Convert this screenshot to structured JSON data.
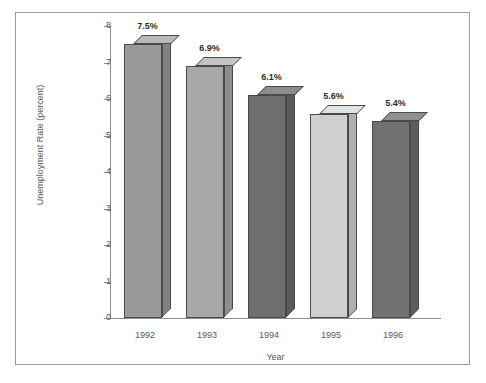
{
  "chart_data": {
    "type": "bar",
    "title": "",
    "subtitle": "",
    "xlabel": "Year",
    "ylabel": "Unemployment Rate (percent)",
    "categories": [
      "1992",
      "1993",
      "1994",
      "1995",
      "1996"
    ],
    "values": [
      7.5,
      6.9,
      6.1,
      5.6,
      5.4
    ],
    "data_labels": [
      "7.5%",
      "6.9%",
      "6.1%",
      "5.6%",
      "5.4%"
    ],
    "ylim": [
      0,
      8
    ],
    "y_ticks": [
      "0",
      "1",
      "2",
      "3",
      "4",
      "5",
      "6",
      "7",
      "8"
    ],
    "grid": false,
    "legend": "none",
    "style": "3d-bars-grayscale",
    "bar_colors": [
      "#9a9a9a",
      "#a8a8a8",
      "#6e6e6e",
      "#cfcfcf",
      "#717171"
    ],
    "bar_top_colors": [
      "#b9b9b9",
      "#c4c4c4",
      "#8d8d8d",
      "#e2e2e2",
      "#8f8f8f"
    ],
    "bar_side_colors": [
      "#828282",
      "#8e8e8e",
      "#5a5a5a",
      "#b0b0b0",
      "#5d5d5d"
    ],
    "axis_color": "#8d8d8d",
    "text_color": "#58585a",
    "frame_color": "#9a9a9a",
    "background": "#ffffff"
  }
}
